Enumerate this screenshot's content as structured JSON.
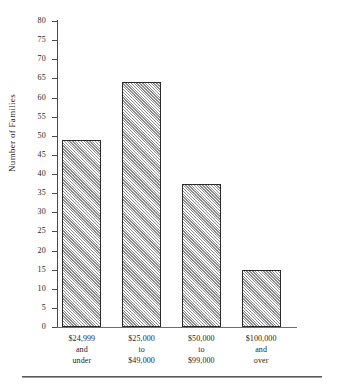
{
  "chart_data": {
    "type": "bar",
    "title": "",
    "xlabel": "",
    "ylabel": "Number of Families",
    "ylim": [
      0,
      80
    ],
    "ytick_step": 5,
    "yticks": [
      80,
      75,
      70,
      65,
      60,
      55,
      50,
      45,
      40,
      35,
      30,
      25,
      20,
      15,
      10,
      5,
      0
    ],
    "grid": false,
    "legend": false,
    "categories": [
      "$24,999 and under",
      "$25,000 to $49,000",
      "$50,000 to $99,000",
      "$100,000 and over"
    ],
    "category_lines": [
      [
        "$24,999",
        "and",
        "under"
      ],
      [
        "$25,000",
        "to",
        "$49,000"
      ],
      [
        "$50,000",
        "to",
        "$99,000"
      ],
      [
        "$100,000",
        "and",
        "over"
      ]
    ],
    "values": [
      49,
      64,
      37.5,
      15
    ],
    "bar_fill": "#f2f2f2",
    "bar_hatch": "forward-diagonal",
    "bar_edge_color": "#2b2b2b",
    "axis_color": "#4a4a4a"
  },
  "figure": {
    "background": "#ffffff",
    "footer_rule_visible": true
  }
}
